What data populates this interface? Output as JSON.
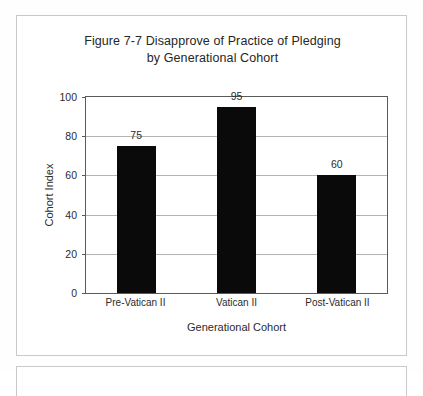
{
  "chart_data": {
    "type": "bar",
    "title": "Figure 7-7 Disapprove of Practice of Pledging by Generational Cohort",
    "title_line1": "Figure 7-7 Disapprove of Practice of Pledging",
    "title_line2": "by Generational Cohort",
    "categories": [
      "Pre-Vatican II",
      "Vatican II",
      "Post-Vatican II"
    ],
    "values": [
      75,
      95,
      60
    ],
    "data_labels": [
      "75",
      "95",
      "60"
    ],
    "xlabel": "Generational Cohort",
    "ylabel": "Cohort Index",
    "ylim": [
      0,
      100
    ],
    "yticks": [
      0,
      20,
      40,
      60,
      80,
      100
    ],
    "ytick_labels": [
      "0",
      "20",
      "40",
      "60",
      "80",
      "100"
    ],
    "grid": true,
    "legend": false,
    "bar_color": "#0a0a0a",
    "grid_color": "#b4b4b4",
    "axis_color": "#5a5a5a"
  }
}
